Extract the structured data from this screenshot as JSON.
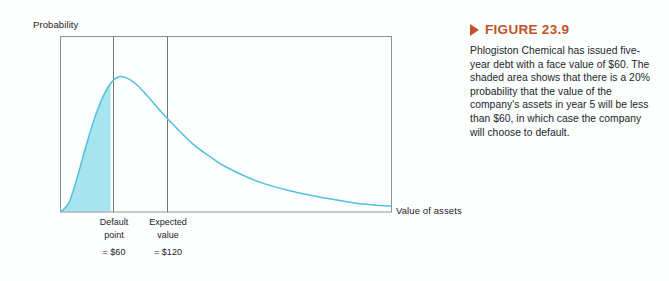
{
  "chart_data": {
    "type": "line",
    "title": "",
    "xlabel": "Value of assets",
    "ylabel": "Probability",
    "grid": false,
    "legend": null,
    "xlim": [
      0,
      400
    ],
    "ylim": [
      0,
      1
    ],
    "series": [
      {
        "name": "Probability density of asset value",
        "x": [
          0,
          10,
          20,
          30,
          40,
          50,
          60,
          70,
          80,
          90,
          100,
          120,
          140,
          160,
          180,
          200,
          240,
          280,
          320,
          360,
          400
        ],
        "y": [
          0.0,
          0.07,
          0.26,
          0.48,
          0.68,
          0.84,
          0.95,
          1.0,
          0.99,
          0.95,
          0.89,
          0.75,
          0.62,
          0.5,
          0.41,
          0.33,
          0.22,
          0.15,
          0.1,
          0.06,
          0.04
        ]
      }
    ],
    "shaded_region": {
      "label": "Default region",
      "from_x": 0,
      "to_x": 60,
      "probability_pct": 20,
      "fill_color": "#a8e4ef"
    },
    "markers": [
      {
        "name": "default-point",
        "x": 60,
        "label_lines": [
          "Default",
          "point"
        ],
        "value_text": "= $60"
      },
      {
        "name": "expected-value",
        "x": 120,
        "label_lines": [
          "Expected",
          "value"
        ],
        "value_text": "= $120"
      }
    ],
    "colors": {
      "curve": "#4fc3dc",
      "fill": "#a8e4ef",
      "frame": "#8a9296",
      "marker_line": "#6f7578",
      "accent": "#c0532a",
      "text": "#20262a"
    }
  },
  "axes": {
    "y_label": "Probability",
    "x_label": "Value of assets"
  },
  "ticks": {
    "default": {
      "line1": "Default",
      "line2": "point",
      "value": "= $60"
    },
    "expected": {
      "line1": "Expected",
      "line2": "value",
      "value": "= $120"
    }
  },
  "figure": {
    "marker_icon": "triangle-right-icon",
    "title": "FIGURE 23.9",
    "caption": "Phlogiston Chemical has issued five-year debt with a face value of $60. The shaded area shows that there is a 20% probability that the value of the company's assets in year 5 will be less than $60, in which case the company will choose to default."
  }
}
